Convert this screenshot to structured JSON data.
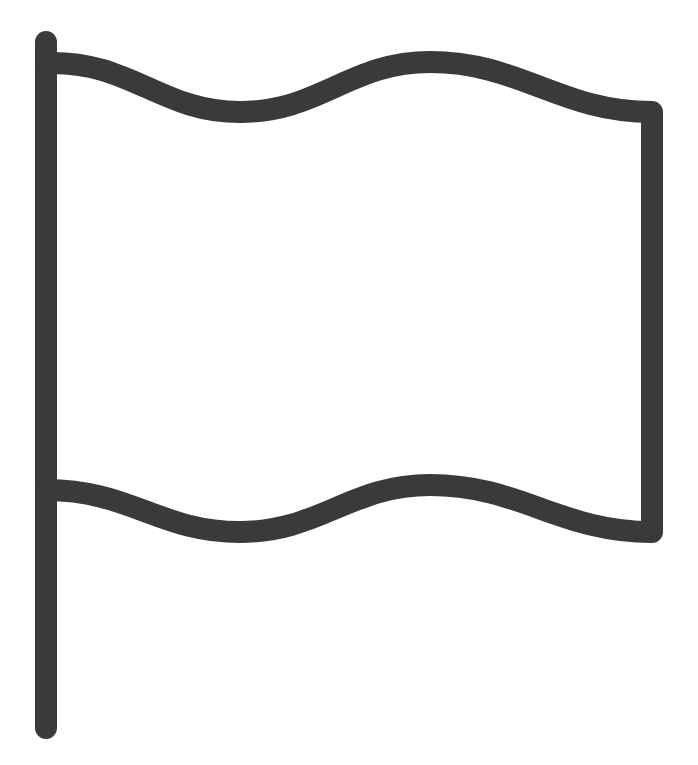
{
  "icon": {
    "name": "flag-icon",
    "stroke_color": "#3a3a3c",
    "background": "#ffffff"
  }
}
